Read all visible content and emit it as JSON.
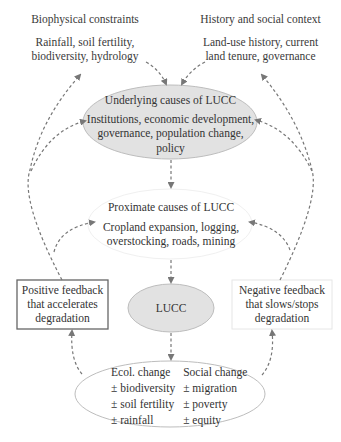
{
  "top_left": {
    "title": "Biophysical constraints",
    "line1": "Rainfall, soil fertility,",
    "line2": "biodiversity, hydrology"
  },
  "top_right": {
    "title": "History and social context",
    "line1": "Land-use history, current",
    "line2": "land tenure, governance"
  },
  "underlying": {
    "title": "Underlying causes of LUCC",
    "line1": "Institutions, economic development,",
    "line2": "governance, population change,",
    "line3": "policy",
    "fill": "#e2e2e2"
  },
  "proximate": {
    "title": "Proximate causes of LUCC",
    "line1": "Cropland expansion, logging,",
    "line2": "overstocking, roads, mining",
    "fill": "#ffffff"
  },
  "lucc": {
    "label": "LUCC",
    "fill": "#e2e2e2"
  },
  "positive_feedback": {
    "line1": "Positive feedback",
    "line2": "that accelerates",
    "line3": "degradation"
  },
  "negative_feedback": {
    "line1": "Negative feedback",
    "line2": "that slows/stops",
    "line3": "degradation"
  },
  "outcomes": {
    "ecol": {
      "title": "Ecol. change",
      "items": [
        "± biodiversity",
        "± soil fertility",
        "± rainfall"
      ]
    },
    "social": {
      "title": "Social change",
      "items": [
        "± migration",
        "± poverty",
        "± equity"
      ]
    }
  },
  "colors": {
    "arrow": "#777777",
    "ellipse_stroke": "#bdbdbd",
    "positive_box_stroke": "#666666",
    "negative_box_stroke": "#e6e6e6"
  }
}
